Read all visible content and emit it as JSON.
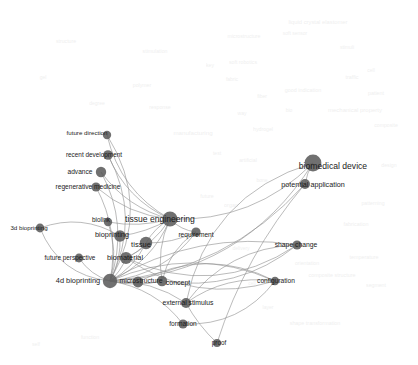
{
  "figure": {
    "type": "network-graph",
    "title": "",
    "background_color": "#ffffff",
    "node_color": "#5c5c5c",
    "edge_color": "#8d8d8d",
    "label_color": "#1b1b1b",
    "watermark_color": "#c9c9c9"
  },
  "chart_data": {
    "type": "scatter",
    "title": "",
    "xlabel": "",
    "ylabel": "",
    "nodes": [
      {
        "id": "future-direction",
        "label": "future direction",
        "x": 107,
        "y": 135,
        "size": 4.2,
        "label_x": 87,
        "label_y": 133,
        "label_size": 6.2,
        "weight": 4
      },
      {
        "id": "recent-development",
        "label": "recent development",
        "x": 108,
        "y": 155,
        "size": 4.8,
        "label_x": 94,
        "label_y": 155,
        "label_size": 6.4,
        "weight": 5
      },
      {
        "id": "advance",
        "label": "advance",
        "x": 101,
        "y": 172,
        "size": 5.2,
        "label_x": 80,
        "label_y": 172,
        "label_size": 6.6,
        "weight": 6
      },
      {
        "id": "regenerative-medicine",
        "label": "regenerative medicine",
        "x": 96,
        "y": 187,
        "size": 4.6,
        "label_x": 88,
        "label_y": 187,
        "label_size": 6.6,
        "weight": 5
      },
      {
        "id": "3d-bioprinting",
        "label": "3d bioprinting",
        "x": 40,
        "y": 228,
        "size": 4.4,
        "label_x": 29,
        "label_y": 228,
        "label_size": 6.2,
        "weight": 4
      },
      {
        "id": "biolink",
        "label": "biolink",
        "x": 108,
        "y": 222,
        "size": 4.2,
        "label_x": 101,
        "label_y": 220,
        "label_size": 6.4,
        "weight": 4
      },
      {
        "id": "tissue-engineering",
        "label": "tissue engineering",
        "x": 170,
        "y": 219,
        "size": 7.6,
        "label_x": 160,
        "label_y": 219,
        "label_size": 8.6,
        "weight": 11
      },
      {
        "id": "bioprinting",
        "label": "bioprinting",
        "x": 120,
        "y": 236,
        "size": 5.8,
        "label_x": 112,
        "label_y": 235,
        "label_size": 7.4,
        "weight": 7
      },
      {
        "id": "requirement",
        "label": "requirement",
        "x": 196,
        "y": 232,
        "size": 4.6,
        "label_x": 196,
        "label_y": 235,
        "label_size": 6.6,
        "weight": 5
      },
      {
        "id": "tissue",
        "label": "tissue",
        "x": 146,
        "y": 243,
        "size": 6.2,
        "label_x": 141,
        "label_y": 245,
        "label_size": 7.6,
        "weight": 8
      },
      {
        "id": "future-perspective",
        "label": "future perspective",
        "x": 79,
        "y": 258,
        "size": 4.4,
        "label_x": 70,
        "label_y": 258,
        "label_size": 6.4,
        "weight": 4
      },
      {
        "id": "biomaterial",
        "label": "biomaterial",
        "x": 126,
        "y": 258,
        "size": 6.0,
        "label_x": 125,
        "label_y": 258,
        "label_size": 7.4,
        "weight": 7
      },
      {
        "id": "4d-bioprinting",
        "label": "4d bioprinting",
        "x": 110,
        "y": 281,
        "size": 7.2,
        "label_x": 78,
        "label_y": 281,
        "label_size": 7.4,
        "weight": 10
      },
      {
        "id": "microstructure",
        "label": "microstructure",
        "x": 138,
        "y": 282,
        "size": 5.4,
        "label_x": 141,
        "label_y": 281,
        "label_size": 6.8,
        "weight": 6
      },
      {
        "id": "concept",
        "label": "concept",
        "x": 162,
        "y": 281,
        "size": 5.2,
        "label_x": 178,
        "label_y": 282,
        "label_size": 7.0,
        "weight": 6
      },
      {
        "id": "biomedical-device",
        "label": "biomedical device",
        "x": 313,
        "y": 163,
        "size": 8.4,
        "label_x": 333,
        "label_y": 166,
        "label_size": 8.6,
        "weight": 12
      },
      {
        "id": "potential-application",
        "label": "potential application",
        "x": 305,
        "y": 184,
        "size": 5.0,
        "label_x": 313,
        "label_y": 185,
        "label_size": 7.2,
        "weight": 6
      },
      {
        "id": "shape-change",
        "label": "shape change",
        "x": 297,
        "y": 245,
        "size": 4.6,
        "label_x": 296,
        "label_y": 245,
        "label_size": 6.8,
        "weight": 5
      },
      {
        "id": "configuration",
        "label": "configuration",
        "x": 275,
        "y": 281,
        "size": 4.2,
        "label_x": 276,
        "label_y": 281,
        "label_size": 6.6,
        "weight": 4
      },
      {
        "id": "external-stimulus",
        "label": "external stimulus",
        "x": 186,
        "y": 303,
        "size": 5.0,
        "label_x": 188,
        "label_y": 303,
        "label_size": 6.8,
        "weight": 6
      },
      {
        "id": "formation",
        "label": "formation",
        "x": 183,
        "y": 324,
        "size": 4.6,
        "label_x": 183,
        "label_y": 324,
        "label_size": 6.6,
        "weight": 5
      },
      {
        "id": "proof",
        "label": "proof",
        "x": 217,
        "y": 343,
        "size": 4.0,
        "label_x": 219,
        "label_y": 343,
        "label_size": 6.4,
        "weight": 3
      }
    ],
    "edges": [
      {
        "source": "4d-bioprinting",
        "target": "future-direction",
        "curve": 0.3
      },
      {
        "source": "4d-bioprinting",
        "target": "recent-development",
        "curve": 0.26
      },
      {
        "source": "4d-bioprinting",
        "target": "advance",
        "curve": 0.22
      },
      {
        "source": "4d-bioprinting",
        "target": "regenerative-medicine",
        "curve": 0.18
      },
      {
        "source": "4d-bioprinting",
        "target": "3d-bioprinting",
        "curve": -0.3
      },
      {
        "source": "4d-bioprinting",
        "target": "biolink",
        "curve": 0.16
      },
      {
        "source": "4d-bioprinting",
        "target": "tissue-engineering",
        "curve": 0.2
      },
      {
        "source": "4d-bioprinting",
        "target": "bioprinting",
        "curve": 0.14
      },
      {
        "source": "4d-bioprinting",
        "target": "tissue",
        "curve": 0.16
      },
      {
        "source": "4d-bioprinting",
        "target": "biomaterial",
        "curve": 0.12
      },
      {
        "source": "4d-bioprinting",
        "target": "future-perspective",
        "curve": -0.18
      },
      {
        "source": "4d-bioprinting",
        "target": "requirement",
        "curve": 0.22
      },
      {
        "source": "4d-bioprinting",
        "target": "microstructure",
        "curve": 0.1
      },
      {
        "source": "4d-bioprinting",
        "target": "concept",
        "curve": 0.12
      },
      {
        "source": "4d-bioprinting",
        "target": "biomedical-device",
        "curve": 0.26
      },
      {
        "source": "4d-bioprinting",
        "target": "potential-application",
        "curve": 0.2
      },
      {
        "source": "4d-bioprinting",
        "target": "shape-change",
        "curve": -0.18
      },
      {
        "source": "4d-bioprinting",
        "target": "configuration",
        "curve": -0.22
      },
      {
        "source": "4d-bioprinting",
        "target": "external-stimulus",
        "curve": -0.16
      },
      {
        "source": "4d-bioprinting",
        "target": "formation",
        "curve": -0.2
      },
      {
        "source": "tissue-engineering",
        "target": "future-direction",
        "curve": -0.22
      },
      {
        "source": "tissue-engineering",
        "target": "recent-development",
        "curve": -0.2
      },
      {
        "source": "tissue-engineering",
        "target": "advance",
        "curve": -0.18
      },
      {
        "source": "tissue-engineering",
        "target": "regenerative-medicine",
        "curve": -0.16
      },
      {
        "source": "tissue-engineering",
        "target": "biolink",
        "curve": -0.12
      },
      {
        "source": "tissue-engineering",
        "target": "bioprinting",
        "curve": -0.1
      },
      {
        "source": "tissue-engineering",
        "target": "tissue",
        "curve": 0.14
      },
      {
        "source": "tissue-engineering",
        "target": "requirement",
        "curve": 0.18
      },
      {
        "source": "tissue-engineering",
        "target": "biomaterial",
        "curve": -0.14
      },
      {
        "source": "tissue-engineering",
        "target": "biomedical-device",
        "curve": 0.22
      },
      {
        "source": "tissue-engineering",
        "target": "concept",
        "curve": 0.16
      },
      {
        "source": "biomedical-device",
        "target": "potential-application",
        "curve": 0.1
      },
      {
        "source": "biomedical-device",
        "target": "external-stimulus",
        "curve": 0.3
      },
      {
        "source": "potential-application",
        "target": "proof",
        "curve": 0.1
      },
      {
        "source": "external-stimulus",
        "target": "proof",
        "curve": 0.08
      },
      {
        "source": "external-stimulus",
        "target": "shape-change",
        "curve": -0.24
      },
      {
        "source": "external-stimulus",
        "target": "configuration",
        "curve": -0.2
      },
      {
        "source": "tissue",
        "target": "requirement",
        "curve": 0.12
      },
      {
        "source": "tissue",
        "target": "biomaterial",
        "curve": -0.12
      },
      {
        "source": "concept",
        "target": "requirement",
        "curve": -0.2
      },
      {
        "source": "concept",
        "target": "shape-change",
        "curve": 0.22
      },
      {
        "source": "microstructure",
        "target": "configuration",
        "curve": -0.26
      },
      {
        "source": "bioprinting",
        "target": "3d-bioprinting",
        "curve": 0.24
      },
      {
        "source": "biomaterial",
        "target": "shape-change",
        "curve": 0.28
      },
      {
        "source": "biomaterial",
        "target": "configuration",
        "curve": 0.24
      },
      {
        "source": "formation",
        "target": "configuration",
        "curve": 0.26
      }
    ],
    "background_labels": [
      {
        "text": "liquid crystal elastomer",
        "x": 318,
        "y": 23,
        "size": 5.8
      },
      {
        "text": "soft sensor",
        "x": 295,
        "y": 33,
        "size": 5.0
      },
      {
        "text": "microstructure",
        "x": 244,
        "y": 37,
        "size": 5.2
      },
      {
        "text": "stimuli",
        "x": 347,
        "y": 47,
        "size": 5.0
      },
      {
        "text": "key",
        "x": 210,
        "y": 65,
        "size": 5.0
      },
      {
        "text": "soft robotics",
        "x": 243,
        "y": 63,
        "size": 5.2
      },
      {
        "text": "traffic",
        "x": 352,
        "y": 78,
        "size": 5.4
      },
      {
        "text": "fabric",
        "x": 232,
        "y": 79,
        "size": 5.0
      },
      {
        "text": "cell",
        "x": 371,
        "y": 70,
        "size": 5.0
      },
      {
        "text": "patient",
        "x": 376,
        "y": 94,
        "size": 5.4
      },
      {
        "text": "fiber",
        "x": 262,
        "y": 96,
        "size": 5.0
      },
      {
        "text": "good indication",
        "x": 303,
        "y": 91,
        "size": 5.4
      },
      {
        "text": "mechanical property",
        "x": 355,
        "y": 110,
        "size": 6.0
      },
      {
        "text": "bio",
        "x": 289,
        "y": 110,
        "size": 5.0
      },
      {
        "text": "composite",
        "x": 386,
        "y": 126,
        "size": 5.2
      },
      {
        "text": "manufacturing",
        "x": 193,
        "y": 133,
        "size": 6.2
      },
      {
        "text": "way",
        "x": 242,
        "y": 113,
        "size": 5.0
      },
      {
        "text": "hydrogel",
        "x": 263,
        "y": 130,
        "size": 5.2
      },
      {
        "text": "test",
        "x": 217,
        "y": 153,
        "size": 5.0
      },
      {
        "text": "artificial",
        "x": 248,
        "y": 161,
        "size": 5.2
      },
      {
        "text": "design",
        "x": 389,
        "y": 166,
        "size": 5.2
      },
      {
        "text": "bone",
        "x": 262,
        "y": 180,
        "size": 5.0
      },
      {
        "text": "future",
        "x": 207,
        "y": 197,
        "size": 5.2
      },
      {
        "text": "organ",
        "x": 231,
        "y": 206,
        "size": 5.4
      },
      {
        "text": "patterning",
        "x": 373,
        "y": 204,
        "size": 5.2
      },
      {
        "text": "fabrication",
        "x": 356,
        "y": 225,
        "size": 5.4
      },
      {
        "text": "delivery",
        "x": 241,
        "y": 248,
        "size": 5.0
      },
      {
        "text": "temperature",
        "x": 364,
        "y": 258,
        "size": 5.4
      },
      {
        "text": "orientation",
        "x": 307,
        "y": 264,
        "size": 5.2
      },
      {
        "text": "composite structure",
        "x": 332,
        "y": 276,
        "size": 5.4
      },
      {
        "text": "segment",
        "x": 376,
        "y": 286,
        "size": 5.2
      },
      {
        "text": "cell",
        "x": 252,
        "y": 283,
        "size": 5.0
      },
      {
        "text": "layer",
        "x": 268,
        "y": 307,
        "size": 5.0
      },
      {
        "text": "shape transformation",
        "x": 315,
        "y": 324,
        "size": 5.4
      },
      {
        "text": "stimulation",
        "x": 155,
        "y": 52,
        "size": 5.2
      },
      {
        "text": "degree",
        "x": 97,
        "y": 103,
        "size": 5.0
      },
      {
        "text": "gel",
        "x": 43,
        "y": 77,
        "size": 5.0
      },
      {
        "text": "polymer",
        "x": 142,
        "y": 86,
        "size": 5.2
      },
      {
        "text": "structure",
        "x": 66,
        "y": 42,
        "size": 5.2
      },
      {
        "text": "response",
        "x": 160,
        "y": 108,
        "size": 5.2
      },
      {
        "text": "self",
        "x": 36,
        "y": 344,
        "size": 5.0
      },
      {
        "text": "function",
        "x": 90,
        "y": 338,
        "size": 5.2
      }
    ]
  }
}
